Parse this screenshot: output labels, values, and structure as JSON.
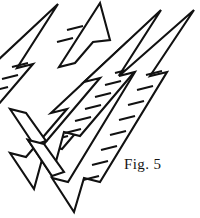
{
  "figure": {
    "caption": "Fig. 5",
    "stroke_color": "#111111",
    "fill_color": "#ffffff",
    "background_color": "#ffffff",
    "canvas": {
      "width": 200,
      "height": 218
    }
  },
  "diagram": {
    "type": "technical-line-drawing",
    "element_count": 4,
    "element_kind": "ladder-double-arrow",
    "arrows": [
      {
        "id": "arrow-1",
        "label": "leftmost-arrow",
        "rungs": 4,
        "angle_degrees": 62,
        "head_tip": {
          "x": 58,
          "y": 4
        },
        "tail_tip": {
          "x": -16,
          "y": 102
        },
        "clipped": "left-edge"
      },
      {
        "id": "arrow-2",
        "label": "second-arrow",
        "rungs": 6,
        "angle_degrees": 62,
        "head_tip": {
          "x": 100,
          "y": 3
        },
        "tail_tip": {
          "x": 17,
          "y": 141
        },
        "clipped": "none"
      },
      {
        "id": "arrow-3",
        "label": "third-arrow",
        "rungs": 7,
        "angle_degrees": 62,
        "head_tip": {
          "x": 143,
          "y": 3
        },
        "tail_tip": {
          "x": 52,
          "y": 176
        },
        "clipped": "none"
      },
      {
        "id": "arrow-4",
        "label": "rightmost-arrow",
        "rungs": 8,
        "angle_degrees": 62,
        "head_tip": {
          "x": 194,
          "y": 10
        },
        "tail_tip": {
          "x": 86,
          "y": 212
        },
        "clipped": "none"
      }
    ]
  }
}
